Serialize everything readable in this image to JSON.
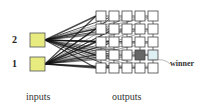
{
  "diagram": {
    "title": "",
    "inputs": [
      {
        "label": "2",
        "y": 33
      },
      {
        "label": "1",
        "y": 57
      }
    ],
    "input_label": "inputs",
    "output_label": "outputs",
    "winner_label": "winner",
    "grid": {
      "rows": 5,
      "cols": 5,
      "x0": 96,
      "y0": 11,
      "cell": 10,
      "step": 13
    },
    "winner_cell": {
      "row": 3,
      "col": 3
    },
    "neighbor_cell": {
      "row": 3,
      "col": 4
    },
    "colors": {
      "input_fill": "#e8ec80",
      "input_stroke": "#555555",
      "cell_stroke": "#444444",
      "winner_fill": "#666666",
      "neighbor_fill": "#dff0f4",
      "edge": "#111111"
    }
  }
}
